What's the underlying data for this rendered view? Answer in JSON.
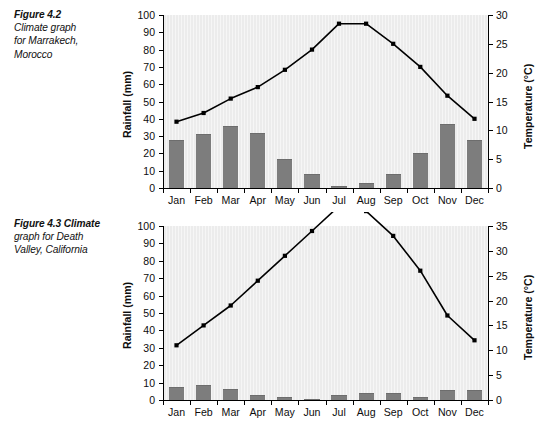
{
  "figures": [
    {
      "caption_figno": "Figure 4.2",
      "caption_rest": " Climate graph for Marrakech, Morocco",
      "caption_lines": [
        "Figure 4.2",
        "Climate graph",
        "for Marrakech,",
        "Morocco"
      ],
      "chart_data": {
        "type": "bar",
        "title": "Climate graph for Marrakech, Morocco",
        "categories": [
          "Jan",
          "Feb",
          "Mar",
          "Apr",
          "May",
          "Jun",
          "Jul",
          "Aug",
          "Sep",
          "Oct",
          "Nov",
          "Dec"
        ],
        "xlabel": "",
        "grid": false,
        "legend": "none",
        "series": [
          {
            "name": "Rainfall",
            "type": "bar",
            "axis": "left",
            "unit": "mm",
            "values": [
              28,
              31,
              36,
              32,
              17,
              8,
              1,
              3,
              8,
              20,
              37,
              28
            ]
          },
          {
            "name": "Temperature",
            "type": "line",
            "axis": "right",
            "unit": "°C",
            "values": [
              11.5,
              13,
              15.5,
              17.5,
              20.5,
              24,
              28.5,
              28.5,
              25,
              21,
              16,
              12
            ]
          }
        ],
        "left_axis": {
          "label": "Rainfall (mm)",
          "ticks": [
            0,
            10,
            20,
            30,
            40,
            50,
            60,
            70,
            80,
            90,
            100
          ],
          "ylim": [
            0,
            100
          ]
        },
        "right_axis": {
          "label": "Temperature (°C)",
          "ticks": [
            0,
            5,
            10,
            15,
            20,
            25,
            30
          ],
          "ylim": [
            0,
            30
          ]
        }
      }
    },
    {
      "caption_figno": "Figure 4.3",
      "caption_rest": " Climate graph for Death Valley, California",
      "caption_lines": [
        "Figure 4.3  Climate",
        "graph for Death",
        "Valley, California"
      ],
      "chart_data": {
        "type": "bar",
        "title": "Climate graph for Death Valley, California",
        "categories": [
          "Jan",
          "Feb",
          "Mar",
          "Apr",
          "May",
          "Jun",
          "Jul",
          "Aug",
          "Sep",
          "Oct",
          "Nov",
          "Dec"
        ],
        "xlabel": "",
        "grid": false,
        "legend": "none",
        "series": [
          {
            "name": "Rainfall",
            "type": "bar",
            "axis": "left",
            "unit": "mm",
            "values": [
              7.5,
              8.5,
              6.5,
              3,
              1.5,
              0.5,
              3,
              4,
              4,
              1.5,
              6,
              6
            ]
          },
          {
            "name": "Temperature",
            "type": "line",
            "axis": "right",
            "unit": "°C",
            "values": [
              11,
              15,
              19,
              24,
              29,
              34,
              39,
              38,
              33,
              26,
              17,
              12
            ]
          }
        ],
        "left_axis": {
          "label": "Rainfall (mm)",
          "ticks": [
            0,
            10,
            20,
            30,
            40,
            50,
            60,
            70,
            80,
            90,
            100
          ],
          "ylim": [
            0,
            100
          ]
        },
        "right_axis": {
          "label": "Temperature (°C)",
          "ticks": [
            0,
            5,
            10,
            15,
            20,
            25,
            30,
            35
          ],
          "ylim": [
            0,
            35
          ]
        }
      }
    }
  ]
}
